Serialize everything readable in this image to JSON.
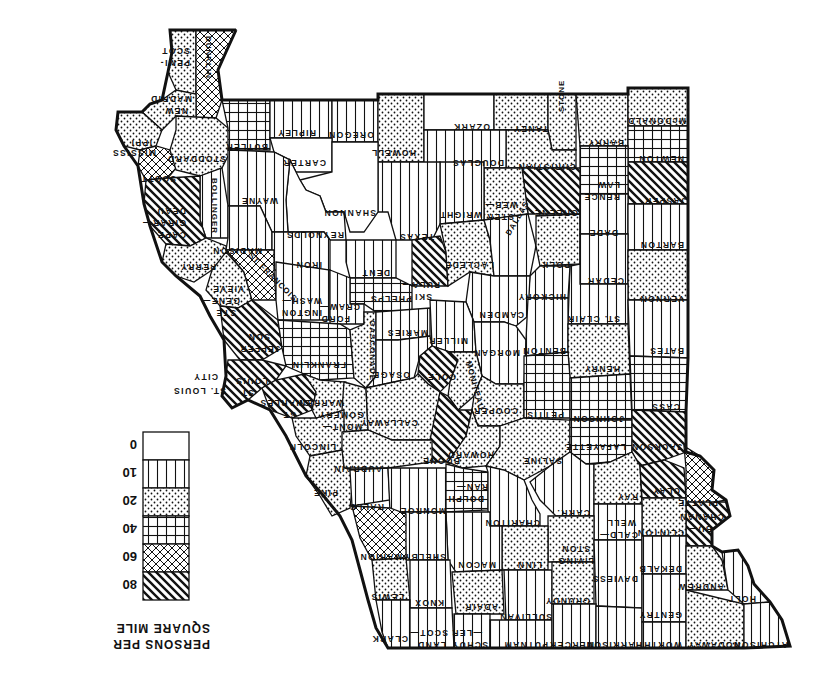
{
  "map": {
    "title": "PERSONS PER SQUARE MILE",
    "orientation": "rotated 180 degrees",
    "region": "Missouri",
    "city_label": "ST. LOUIS CITY"
  },
  "legend": {
    "title_line1": "PERSONS PER",
    "title_line2": "SQUARE MILE",
    "classes": [
      {
        "value": "0",
        "pattern": "blank"
      },
      {
        "value": "10",
        "pattern": "vertical-lines"
      },
      {
        "value": "20",
        "pattern": "dots"
      },
      {
        "value": "40",
        "pattern": "grid"
      },
      {
        "value": "60",
        "pattern": "crosshatch"
      },
      {
        "value": "80",
        "pattern": "diagonal"
      }
    ]
  },
  "colors": {
    "ink": "#111111",
    "paper": "#ffffff"
  },
  "counties": [
    {
      "name": "PEMI-SCOT",
      "class": "20"
    },
    {
      "name": "DUNKLIN",
      "class": "60"
    },
    {
      "name": "NEW MADRID",
      "class": "20"
    },
    {
      "name": "MISSISSIPPI",
      "class": "20"
    },
    {
      "name": "SCOTT",
      "class": "60"
    },
    {
      "name": "STODDARD",
      "class": "20"
    },
    {
      "name": "BUTLER",
      "class": "40"
    },
    {
      "name": "RIPLEY",
      "class": "10"
    },
    {
      "name": "OREGON",
      "class": "10"
    },
    {
      "name": "CARTER",
      "class": "0"
    },
    {
      "name": "HOWELL",
      "class": "20"
    },
    {
      "name": "OZARK",
      "class": "0"
    },
    {
      "name": "TANEY",
      "class": "20"
    },
    {
      "name": "STONE",
      "class": "20"
    },
    {
      "name": "BARRY",
      "class": "20"
    },
    {
      "name": "MCDONALD",
      "class": "20"
    },
    {
      "name": "NEWTON",
      "class": "40"
    },
    {
      "name": "JASPER",
      "class": "80"
    },
    {
      "name": "LAW-RENCE",
      "class": "40"
    },
    {
      "name": "CHRISTIAN",
      "class": "20"
    },
    {
      "name": "DOUGLAS",
      "class": "10"
    },
    {
      "name": "GREENE",
      "class": "80"
    },
    {
      "name": "WEB-STER",
      "class": "20"
    },
    {
      "name": "WRIGHT",
      "class": "10"
    },
    {
      "name": "TEXAS",
      "class": "10"
    },
    {
      "name": "SHANNON",
      "class": "0"
    },
    {
      "name": "REYNOLDS",
      "class": "0"
    },
    {
      "name": "WAYNE",
      "class": "10"
    },
    {
      "name": "BOLLINGER",
      "class": "10"
    },
    {
      "name": "CAPE GIRAR-DEAU",
      "class": "80"
    },
    {
      "name": "PERRY",
      "class": "20"
    },
    {
      "name": "MADISON",
      "class": "10"
    },
    {
      "name": "IRON",
      "class": "10"
    },
    {
      "name": "DENT",
      "class": "10"
    },
    {
      "name": "PHELPS",
      "class": "40"
    },
    {
      "name": "PULA-SKI",
      "class": "80"
    },
    {
      "name": "LACLEDE",
      "class": "20"
    },
    {
      "name": "DALLAS",
      "class": "10"
    },
    {
      "name": "POLK",
      "class": "20"
    },
    {
      "name": "DADE",
      "class": "10"
    },
    {
      "name": "BARTON",
      "class": "10"
    },
    {
      "name": "CEDAR",
      "class": "10"
    },
    {
      "name": "VERNON",
      "class": "20"
    },
    {
      "name": "ST. CLAIR",
      "class": "10"
    },
    {
      "name": "HICKORY",
      "class": "10"
    },
    {
      "name": "CAMDEN",
      "class": "10"
    },
    {
      "name": "STE GENE-VIEVE",
      "class": "20"
    },
    {
      "name": "ST FRANCOIS",
      "class": "60"
    },
    {
      "name": "WASH-INGTON",
      "class": "10"
    },
    {
      "name": "CRAW-FORD",
      "class": "10"
    },
    {
      "name": "JEFFER-SON",
      "class": "80"
    },
    {
      "name": "FRANKLIN",
      "class": "40"
    },
    {
      "name": "GASCONADE",
      "class": "20"
    },
    {
      "name": "MARIES",
      "class": "10"
    },
    {
      "name": "MILLER",
      "class": "10"
    },
    {
      "name": "MORGAN",
      "class": "10"
    },
    {
      "name": "BENTON",
      "class": "10"
    },
    {
      "name": "BATES",
      "class": "10"
    },
    {
      "name": "HENRY",
      "class": "20"
    },
    {
      "name": "ST LOUIS",
      "class": "80"
    },
    {
      "name": "ST CHARLES",
      "class": "80"
    },
    {
      "name": "WARREN",
      "class": "20"
    },
    {
      "name": "OSAGE",
      "class": "10"
    },
    {
      "name": "COLE",
      "class": "80"
    },
    {
      "name": "MONITEAU",
      "class": "20"
    },
    {
      "name": "COOPER",
      "class": "20"
    },
    {
      "name": "PETTIS",
      "class": "40"
    },
    {
      "name": "JOHNSON",
      "class": "40"
    },
    {
      "name": "CASS",
      "class": "40"
    },
    {
      "name": "MONT-GOMERY",
      "class": "20"
    },
    {
      "name": "CALLAWAY",
      "class": "20"
    },
    {
      "name": "BOONE",
      "class": "80"
    },
    {
      "name": "HOWARD",
      "class": "20"
    },
    {
      "name": "SALINE",
      "class": "20"
    },
    {
      "name": "LAFAYETTE",
      "class": "40"
    },
    {
      "name": "JACKSON",
      "class": "80"
    },
    {
      "name": "LINCOLN",
      "class": "20"
    },
    {
      "name": "AUDRAIN",
      "class": "20"
    },
    {
      "name": "PIKE",
      "class": "20"
    },
    {
      "name": "RALLS",
      "class": "10"
    },
    {
      "name": "MONROE",
      "class": "10"
    },
    {
      "name": "RAN-DOLPH",
      "class": "40"
    },
    {
      "name": "CHARITON",
      "class": "10"
    },
    {
      "name": "CARR.",
      "class": "10"
    },
    {
      "name": "RAY",
      "class": "20"
    },
    {
      "name": "CLAY",
      "class": "80"
    },
    {
      "name": "PLATTE",
      "class": "60"
    },
    {
      "name": "BU-CHANAN",
      "class": "80"
    },
    {
      "name": "CLINTON",
      "class": "20"
    },
    {
      "name": "CALD-WELL",
      "class": "10"
    },
    {
      "name": "LIVING-STON",
      "class": "20"
    },
    {
      "name": "LINN",
      "class": "20"
    },
    {
      "name": "MACON",
      "class": "10"
    },
    {
      "name": "SHELBY",
      "class": "10"
    },
    {
      "name": "MARION",
      "class": "60"
    },
    {
      "name": "LEWIS",
      "class": "20"
    },
    {
      "name": "KNOX",
      "class": "10"
    },
    {
      "name": "ADAIR",
      "class": "20"
    },
    {
      "name": "SULLIVAN",
      "class": "10"
    },
    {
      "name": "GRUNDY",
      "class": "20"
    },
    {
      "name": "DAVIESS",
      "class": "10"
    },
    {
      "name": "DEKALB",
      "class": "10"
    },
    {
      "name": "ANDREW",
      "class": "20"
    },
    {
      "name": "HOLT",
      "class": "10"
    },
    {
      "name": "CLARK",
      "class": "10"
    },
    {
      "name": "SCOT-LAND",
      "class": "10"
    },
    {
      "name": "SCHUY-LER",
      "class": "10"
    },
    {
      "name": "PUTNAM",
      "class": "10"
    },
    {
      "name": "MERCER",
      "class": "10"
    },
    {
      "name": "HARRISON",
      "class": "10"
    },
    {
      "name": "WORTH",
      "class": "10"
    },
    {
      "name": "GENTRY",
      "class": "10"
    },
    {
      "name": "NODAWAY",
      "class": "20"
    },
    {
      "name": "ATCHISON",
      "class": "10"
    }
  ]
}
